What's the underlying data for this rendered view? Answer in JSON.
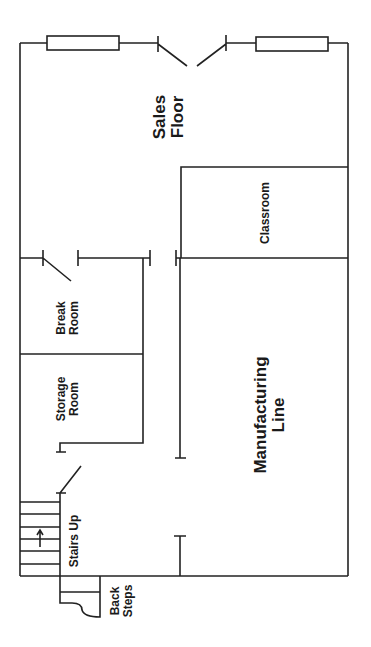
{
  "diagram": {
    "type": "floor-plan",
    "orientation": "rotated-90-ccw",
    "line_color": "#222222",
    "background": "#ffffff"
  },
  "rooms": {
    "sales_floor": {
      "line1": "Sales",
      "line2": "Floor"
    },
    "classroom": {
      "label": "Classroom"
    },
    "break_room": {
      "line1": "Break",
      "line2": "Room"
    },
    "storage_room": {
      "line1": "Storage",
      "line2": "Room"
    },
    "manufacturing_line": {
      "line1": "Manufacturing",
      "line2": "Line"
    },
    "stairs": {
      "label": "Stairs Up",
      "arrow": "↑"
    },
    "back_steps": {
      "line1": "Back",
      "line2": "Steps"
    }
  },
  "features": {
    "windows": 2,
    "front_doors": 2
  }
}
